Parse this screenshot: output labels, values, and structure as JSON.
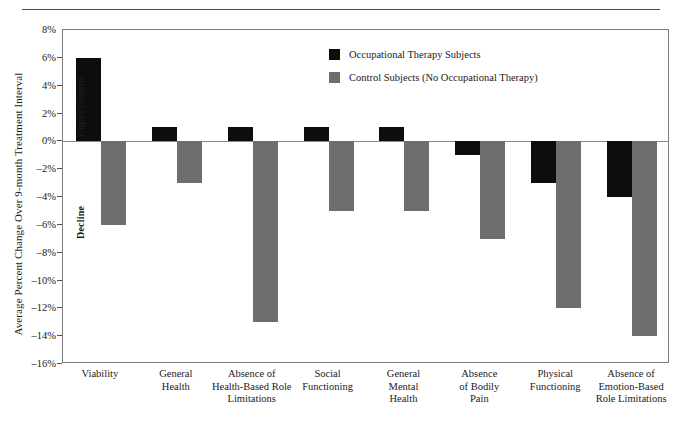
{
  "chart_data": {
    "type": "bar",
    "title": "",
    "xlabel": "",
    "ylabel": "Average Percent Change Over 9-month Treatment Interval",
    "ylim": [
      -16,
      8
    ],
    "ytick_step": 2,
    "ytick_labels": [
      "8%",
      "6%",
      "4%",
      "2%",
      "0%",
      "–2%",
      "–4%",
      "–6%",
      "–8%",
      "–10%",
      "–12%",
      "–14%",
      "–16%"
    ],
    "ytick_values": [
      8,
      6,
      4,
      2,
      0,
      -2,
      -4,
      -6,
      -8,
      -10,
      -12,
      -14,
      -16
    ],
    "grid": false,
    "legend_position": "top-right",
    "categories": [
      "Viability",
      "General Health",
      "Absence of Health-Based Role Limitations",
      "Social Functioning",
      "General Mental Health",
      "Absence of Bodily Pain",
      "Physical Functioning",
      "Absence of Emotion-Based Role Limitations"
    ],
    "category_lines": [
      [
        "Viability"
      ],
      [
        "General",
        "Health"
      ],
      [
        "Absence of",
        "Health-Based Role",
        "Limitations"
      ],
      [
        "Social",
        "Functioning"
      ],
      [
        "General",
        "Mental",
        "Health"
      ],
      [
        "Absence",
        "of Bodily",
        "Pain"
      ],
      [
        "Physical",
        "Functioning"
      ],
      [
        "Absence of",
        "Emotion-Based",
        "Role Limitations"
      ]
    ],
    "series": [
      {
        "name": "Occupational Therapy Subjects",
        "color": "#0d0d0d",
        "values": [
          6,
          1,
          1,
          1,
          1,
          -1,
          -3,
          -4
        ]
      },
      {
        "name": "Control Subjects (No Occupational Therapy)",
        "color": "#6e6e6e",
        "values": [
          -6,
          -3,
          -13,
          -5,
          -5,
          -7,
          -12,
          -14
        ]
      }
    ],
    "annotations": [
      {
        "text": "Improvement",
        "region": "above-zero"
      },
      {
        "text": "Decline",
        "region": "below-zero"
      }
    ]
  },
  "legend": {
    "items": [
      {
        "label": "Occupational Therapy Subjects",
        "swatch": "treatment"
      },
      {
        "label": "Control Subjects (No Occupational Therapy)",
        "swatch": "control"
      }
    ]
  },
  "axis_labels": {
    "improvement": "Improvement",
    "decline": "Decline"
  }
}
